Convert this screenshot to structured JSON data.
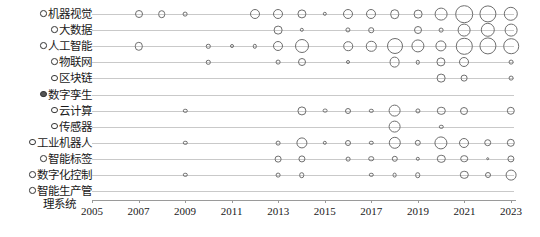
{
  "chart_data": {
    "type": "scatter",
    "title": "",
    "xlabel": "",
    "ylabel": "",
    "grid": true,
    "legend": "none",
    "size_encoding": "bubble-radius-proportional-to-frequency",
    "xlim": [
      2005,
      2024
    ],
    "x_tick_labels": [
      "2005",
      "2007",
      "2009",
      "2011",
      "2013",
      "2015",
      "2017",
      "2019",
      "2021",
      "2023"
    ],
    "x_ticks": [
      2005,
      2007,
      2009,
      2011,
      2013,
      2015,
      2017,
      2019,
      2021,
      2023
    ],
    "categories": [
      {
        "label": "机器视觉",
        "bullet": "open"
      },
      {
        "label": "大数据",
        "bullet": "open"
      },
      {
        "label": "人工智能",
        "bullet": "open"
      },
      {
        "label": "物联网",
        "bullet": "open"
      },
      {
        "label": "区块链",
        "bullet": "open"
      },
      {
        "label": "数字孪生",
        "bullet": "filled"
      },
      {
        "label": "云计算",
        "bullet": "open"
      },
      {
        "label": "传感器",
        "bullet": "open"
      },
      {
        "label": "工业机器人",
        "bullet": "open"
      },
      {
        "label": "智能标签",
        "bullet": "open"
      },
      {
        "label": "数字化控制",
        "bullet": "open"
      },
      {
        "label": "智能生产管",
        "label2": "理系统",
        "bullet": "open"
      }
    ],
    "series": [
      {
        "name": "机器视觉",
        "points": [
          {
            "x": 2007,
            "r": 4.0
          },
          {
            "x": 2008,
            "r": 3.8
          },
          {
            "x": 2009,
            "r": 2.4
          },
          {
            "x": 2012,
            "r": 5.0
          },
          {
            "x": 2013,
            "r": 5.0
          },
          {
            "x": 2014,
            "r": 4.6
          },
          {
            "x": 2015,
            "r": 2.2
          },
          {
            "x": 2016,
            "r": 5.0
          },
          {
            "x": 2017,
            "r": 5.0
          },
          {
            "x": 2018,
            "r": 4.8
          },
          {
            "x": 2019,
            "r": 4.4
          },
          {
            "x": 2020,
            "r": 6.4
          },
          {
            "x": 2021,
            "r": 8.8
          },
          {
            "x": 2022,
            "r": 8.6
          },
          {
            "x": 2023,
            "r": 7.2
          }
        ]
      },
      {
        "name": "大数据",
        "points": [
          {
            "x": 2013,
            "r": 4.4
          },
          {
            "x": 2014,
            "r": 2.2
          },
          {
            "x": 2016,
            "r": 2.6
          },
          {
            "x": 2017,
            "r": 2.8
          },
          {
            "x": 2019,
            "r": 4.0
          },
          {
            "x": 2020,
            "r": 2.4
          },
          {
            "x": 2021,
            "r": 6.4
          },
          {
            "x": 2022,
            "r": 7.2
          },
          {
            "x": 2023,
            "r": 6.4
          }
        ]
      },
      {
        "name": "人工智能",
        "points": [
          {
            "x": 2007,
            "r": 4.2
          },
          {
            "x": 2010,
            "r": 2.2
          },
          {
            "x": 2011,
            "r": 2.0
          },
          {
            "x": 2012,
            "r": 2.2
          },
          {
            "x": 2013,
            "r": 5.0
          },
          {
            "x": 2014,
            "r": 7.0
          },
          {
            "x": 2016,
            "r": 4.8
          },
          {
            "x": 2017,
            "r": 5.2
          },
          {
            "x": 2018,
            "r": 8.0
          },
          {
            "x": 2019,
            "r": 6.6
          },
          {
            "x": 2020,
            "r": 5.6
          },
          {
            "x": 2021,
            "r": 8.2
          },
          {
            "x": 2022,
            "r": 8.6
          },
          {
            "x": 2023,
            "r": 7.8
          }
        ]
      },
      {
        "name": "物联网",
        "points": [
          {
            "x": 2010,
            "r": 2.2
          },
          {
            "x": 2013,
            "r": 2.4
          },
          {
            "x": 2014,
            "r": 4.0
          },
          {
            "x": 2016,
            "r": 2.0
          },
          {
            "x": 2018,
            "r": 5.4
          },
          {
            "x": 2019,
            "r": 2.2
          },
          {
            "x": 2020,
            "r": 4.6
          },
          {
            "x": 2021,
            "r": 5.0
          },
          {
            "x": 2023,
            "r": 2.4
          }
        ]
      },
      {
        "name": "区块链",
        "points": [
          {
            "x": 2020,
            "r": 4.4
          },
          {
            "x": 2021,
            "r": 3.4
          },
          {
            "x": 2023,
            "r": 2.4
          }
        ]
      },
      {
        "name": "数字孪生",
        "points": []
      },
      {
        "name": "云计算",
        "points": [
          {
            "x": 2009,
            "r": 2.2
          },
          {
            "x": 2014,
            "r": 4.6
          },
          {
            "x": 2015,
            "r": 2.4
          },
          {
            "x": 2016,
            "r": 3.0
          },
          {
            "x": 2017,
            "r": 2.2
          },
          {
            "x": 2018,
            "r": 6.4
          },
          {
            "x": 2019,
            "r": 2.6
          },
          {
            "x": 2020,
            "r": 4.2
          },
          {
            "x": 2021,
            "r": 4.0
          },
          {
            "x": 2023,
            "r": 4.2
          }
        ]
      },
      {
        "name": "传感器",
        "points": [
          {
            "x": 2018,
            "r": 6.4
          },
          {
            "x": 2020,
            "r": 2.2
          }
        ]
      },
      {
        "name": "工业机器人",
        "points": [
          {
            "x": 2009,
            "r": 2.2
          },
          {
            "x": 2013,
            "r": 2.4
          },
          {
            "x": 2014,
            "r": 5.6
          },
          {
            "x": 2015,
            "r": 2.2
          },
          {
            "x": 2016,
            "r": 3.0
          },
          {
            "x": 2017,
            "r": 2.2
          },
          {
            "x": 2018,
            "r": 6.2
          },
          {
            "x": 2019,
            "r": 3.2
          },
          {
            "x": 2020,
            "r": 6.6
          },
          {
            "x": 2021,
            "r": 5.0
          },
          {
            "x": 2022,
            "r": 3.8
          },
          {
            "x": 2023,
            "r": 4.2
          }
        ]
      },
      {
        "name": "智能标签",
        "points": [
          {
            "x": 2013,
            "r": 3.4
          },
          {
            "x": 2014,
            "r": 3.6
          },
          {
            "x": 2016,
            "r": 2.4
          },
          {
            "x": 2017,
            "r": 2.8
          },
          {
            "x": 2018,
            "r": 3.2
          },
          {
            "x": 2019,
            "r": 2.2
          },
          {
            "x": 2020,
            "r": 4.2
          },
          {
            "x": 2021,
            "r": 3.8
          },
          {
            "x": 2022,
            "r": 1.8
          },
          {
            "x": 2023,
            "r": 3.6
          }
        ]
      },
      {
        "name": "数字化控制",
        "points": [
          {
            "x": 2009,
            "r": 2.2
          },
          {
            "x": 2013,
            "r": 2.4
          },
          {
            "x": 2014,
            "r": 2.8
          },
          {
            "x": 2017,
            "r": 2.2
          },
          {
            "x": 2018,
            "r": 2.4
          },
          {
            "x": 2019,
            "r": 2.8
          },
          {
            "x": 2021,
            "r": 4.2
          },
          {
            "x": 2022,
            "r": 3.0
          },
          {
            "x": 2023,
            "r": 5.4
          }
        ]
      },
      {
        "name": "智能生产管理系统",
        "points": []
      }
    ]
  }
}
